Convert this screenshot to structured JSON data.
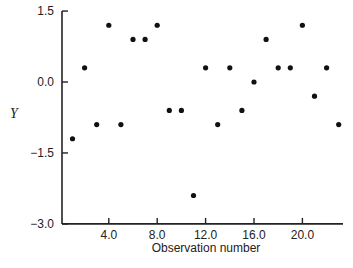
{
  "chart_data": {
    "type": "scatter",
    "title": "",
    "xlabel": "Observation number",
    "ylabel": "Y",
    "xlim": [
      0.3,
      23.5
    ],
    "ylim": [
      -3.0,
      1.5
    ],
    "xticks": [
      4.0,
      8.0,
      12.0,
      16.0,
      20.0
    ],
    "xtick_labels": [
      "4.0",
      "8.0",
      "12.0",
      "16.0",
      "20.0"
    ],
    "yticks": [
      1.5,
      0.0,
      -1.5,
      -3.0
    ],
    "ytick_labels": [
      "1.5",
      "0.0",
      "−1.5",
      "−3.0"
    ],
    "grid": false,
    "legend": null,
    "series": [
      {
        "name": "Y",
        "x": [
          1,
          2,
          3,
          4,
          5,
          6,
          7,
          8,
          9,
          10,
          11,
          12,
          13,
          14,
          15,
          16,
          17,
          18,
          19,
          20,
          21,
          22,
          23
        ],
        "y": [
          -1.2,
          0.3,
          -0.9,
          1.2,
          -0.9,
          0.9,
          0.9,
          1.2,
          -0.6,
          -0.6,
          -2.4,
          0.3,
          -0.9,
          0.3,
          -0.6,
          0.0,
          0.9,
          0.3,
          0.3,
          1.2,
          -0.3,
          0.3,
          -0.9
        ]
      }
    ],
    "colors": {
      "axis": "#222222",
      "point": "#111111",
      "background": "#ffffff"
    }
  }
}
